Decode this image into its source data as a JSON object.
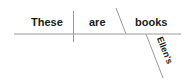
{
  "diagram": {
    "type": "sentence-diagram",
    "sentence": "These are Ellen's books",
    "words": {
      "subject": "These",
      "verb": "are",
      "complement": "books",
      "modifier": "Ellen's"
    },
    "colors": {
      "line": "#9a9a9a",
      "text": "#1a1a1a",
      "background": "#ffffff"
    }
  }
}
